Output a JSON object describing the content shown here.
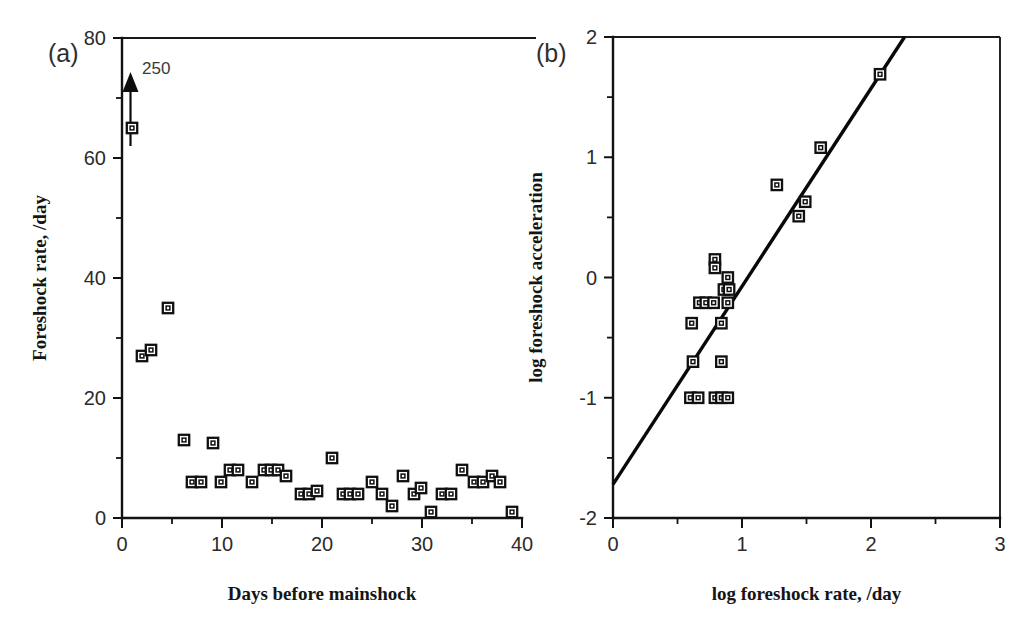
{
  "figure": {
    "background_color": "#ffffff",
    "marker_color": "#101010",
    "line_color": "#080808"
  },
  "panels": {
    "a": {
      "tag": "(a)",
      "annotation": "250",
      "annotation_name": "offscale-value-250"
    },
    "b": {
      "tag": "(b)"
    }
  },
  "chart_data": [
    {
      "type": "scatter",
      "panel": "(a)",
      "title": "",
      "xlabel": "Days before mainshock",
      "ylabel": "Foreshock rate, /day",
      "xlim": [
        0,
        40
      ],
      "ylim": [
        0,
        80
      ],
      "xticks": [
        0,
        10,
        20,
        30,
        40
      ],
      "xtick_labels": [
        "0",
        "10",
        "20",
        "30",
        "40"
      ],
      "xminor_ticks": [
        5,
        15,
        25,
        35
      ],
      "yticks": [
        0,
        20,
        40,
        60,
        80
      ],
      "ytick_labels": [
        "0",
        "20",
        "40",
        "60",
        "80"
      ],
      "yminor_ticks": [
        10,
        30,
        50,
        70
      ],
      "grid": false,
      "legend": "none",
      "annotations": [
        {
          "text": "250",
          "x": 1.4,
          "y": 75,
          "arrow": true,
          "arrow_from_y": 62,
          "arrow_to_y": 74,
          "arrow_x": 0.85,
          "note": "off-scale point at 250 per day indicated by upward arrow"
        }
      ],
      "points": [
        {
          "x": 1.0,
          "y": 65
        },
        {
          "x": 2.0,
          "y": 27
        },
        {
          "x": 2.9,
          "y": 28
        },
        {
          "x": 4.6,
          "y": 35
        },
        {
          "x": 6.2,
          "y": 13
        },
        {
          "x": 7.0,
          "y": 6
        },
        {
          "x": 7.9,
          "y": 6
        },
        {
          "x": 9.1,
          "y": 12.5
        },
        {
          "x": 9.9,
          "y": 6
        },
        {
          "x": 10.8,
          "y": 8
        },
        {
          "x": 11.6,
          "y": 8
        },
        {
          "x": 13.0,
          "y": 6
        },
        {
          "x": 14.2,
          "y": 8
        },
        {
          "x": 14.9,
          "y": 8
        },
        {
          "x": 15.6,
          "y": 8
        },
        {
          "x": 16.4,
          "y": 7
        },
        {
          "x": 17.9,
          "y": 4
        },
        {
          "x": 18.7,
          "y": 4
        },
        {
          "x": 19.5,
          "y": 4.5
        },
        {
          "x": 21.0,
          "y": 10
        },
        {
          "x": 22.1,
          "y": 4
        },
        {
          "x": 22.8,
          "y": 4
        },
        {
          "x": 23.6,
          "y": 4
        },
        {
          "x": 25.0,
          "y": 6
        },
        {
          "x": 26.0,
          "y": 4
        },
        {
          "x": 27.0,
          "y": 2
        },
        {
          "x": 28.1,
          "y": 7
        },
        {
          "x": 29.2,
          "y": 4
        },
        {
          "x": 29.9,
          "y": 5
        },
        {
          "x": 30.9,
          "y": 1
        },
        {
          "x": 32.0,
          "y": 4
        },
        {
          "x": 32.9,
          "y": 4
        },
        {
          "x": 34.0,
          "y": 8
        },
        {
          "x": 35.2,
          "y": 6
        },
        {
          "x": 36.1,
          "y": 6
        },
        {
          "x": 37.0,
          "y": 7
        },
        {
          "x": 37.8,
          "y": 6
        },
        {
          "x": 39.0,
          "y": 1
        }
      ]
    },
    {
      "type": "scatter",
      "panel": "(b)",
      "title": "",
      "xlabel": "log foreshock rate, /day",
      "ylabel": "log foreshock acceleration",
      "xlim": [
        0,
        3
      ],
      "ylim": [
        -2,
        2
      ],
      "xticks": [
        0,
        1,
        2,
        3
      ],
      "xtick_labels": [
        "0",
        "1",
        "2",
        "3"
      ],
      "xminor_ticks": [
        0.5,
        1.5,
        2.5
      ],
      "yticks": [
        -2,
        -1,
        0,
        1,
        2
      ],
      "ytick_labels": [
        "-2",
        "-1",
        "0",
        "1",
        "2"
      ],
      "yminor_ticks": [
        -1.5,
        -0.5,
        0.5,
        1.5
      ],
      "grid": false,
      "legend": "none",
      "points": [
        {
          "x": 0.6,
          "y": -1.0
        },
        {
          "x": 0.66,
          "y": -1.0
        },
        {
          "x": 0.79,
          "y": -1.0
        },
        {
          "x": 0.84,
          "y": -1.0
        },
        {
          "x": 0.89,
          "y": -1.0
        },
        {
          "x": 0.62,
          "y": -0.7
        },
        {
          "x": 0.84,
          "y": -0.7
        },
        {
          "x": 0.61,
          "y": -0.38
        },
        {
          "x": 0.84,
          "y": -0.38
        },
        {
          "x": 0.67,
          "y": -0.21
        },
        {
          "x": 0.72,
          "y": -0.21
        },
        {
          "x": 0.78,
          "y": -0.21
        },
        {
          "x": 0.89,
          "y": -0.21
        },
        {
          "x": 0.86,
          "y": -0.1
        },
        {
          "x": 0.9,
          "y": -0.1
        },
        {
          "x": 0.89,
          "y": 0.0
        },
        {
          "x": 0.79,
          "y": 0.15
        },
        {
          "x": 0.79,
          "y": 0.08
        },
        {
          "x": 1.27,
          "y": 0.77
        },
        {
          "x": 1.44,
          "y": 0.51
        },
        {
          "x": 1.49,
          "y": 0.63
        },
        {
          "x": 1.61,
          "y": 1.08
        },
        {
          "x": 2.07,
          "y": 1.69
        }
      ],
      "fit_line": {
        "name": "regression-line",
        "x1": 0.0,
        "y1": -1.72,
        "x2": 2.26,
        "y2": 2.0,
        "slope": 1.65,
        "intercept": -1.72
      }
    }
  ]
}
